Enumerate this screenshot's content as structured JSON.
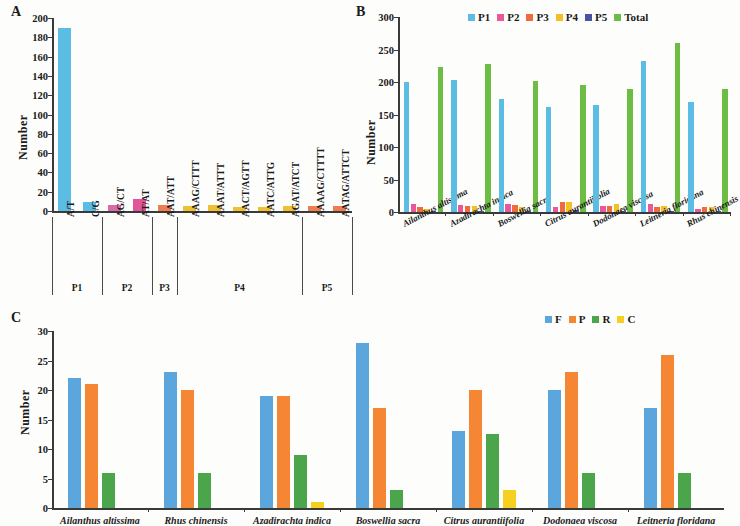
{
  "figure": {
    "panels": [
      "A",
      "B",
      "C"
    ],
    "axis_title": "Number"
  },
  "panelA": {
    "letter": "A",
    "ylabel": "Number",
    "yticks": [
      "0",
      "20",
      "40",
      "60",
      "80",
      "100",
      "120",
      "140",
      "160",
      "180",
      "200"
    ],
    "groups": [
      {
        "label": "P1",
        "members": [
          "A/T",
          "C/G"
        ]
      },
      {
        "label": "P2",
        "members": [
          "AG/CT",
          "AT/AT"
        ]
      },
      {
        "label": "P3",
        "members": [
          "AAT/ATT"
        ]
      },
      {
        "label": "P4",
        "members": [
          "AAAG/CTTT",
          "AAAT/ATTT",
          "AACT/AGTT",
          "AATC/ATTG",
          "AGAT/ATCT"
        ]
      },
      {
        "label": "P5",
        "members": [
          "AAAAG/CTTTT",
          "AATAG/ATTCT"
        ]
      }
    ],
    "chart_data": {
      "type": "bar",
      "title": "",
      "xlabel": "",
      "ylabel": "Number",
      "ylim": [
        0,
        200
      ],
      "categories": [
        "A/T",
        "C/G",
        "AG/CT",
        "AT/AT",
        "AAT/ATT",
        "AAAG/CTTT",
        "AAAT/ATTT",
        "AACT/AGTT",
        "AATC/ATTG",
        "AGAT/ATCT",
        "AAAAG/CTTTT",
        "AATAG/ATTCT"
      ],
      "values": [
        190,
        9,
        6,
        12,
        6,
        5,
        6,
        4,
        4,
        5,
        5,
        5
      ],
      "colors": [
        "#5bbce4",
        "#5bbce4",
        "#d96ba8",
        "#e2559a",
        "#ef7d52",
        "#efc132",
        "#efc132",
        "#efc132",
        "#efc132",
        "#efc132",
        "#ef7d52",
        "#ef7d52"
      ],
      "grid": false,
      "legend_position": "none"
    }
  },
  "panelB": {
    "letter": "B",
    "ylabel": "Number",
    "yticks": [
      "0",
      "50",
      "100",
      "150",
      "200",
      "250",
      "300"
    ],
    "legend": [
      {
        "label": "P1",
        "color": "#5bbce4"
      },
      {
        "label": "P2",
        "color": "#e8589b"
      },
      {
        "label": "P3",
        "color": "#ef6a3c"
      },
      {
        "label": "P4",
        "color": "#f5c026"
      },
      {
        "label": "P5",
        "color": "#4a53a2"
      },
      {
        "label": "Total",
        "color": "#6dbd45"
      }
    ],
    "chart_data": {
      "type": "bar",
      "title": "",
      "xlabel": "",
      "ylabel": "Number",
      "ylim": [
        0,
        300
      ],
      "categories": [
        "Ailanthus altissima",
        "Azadirachta indica",
        "Boswellia sacra",
        "Citrus aurantiifolia",
        "Dodonaea viscosa",
        "Leitneria floridana",
        "Rhus chinensis"
      ],
      "series": [
        {
          "name": "P1",
          "color": "#5bbce4",
          "values": [
            200,
            203,
            174,
            161,
            165,
            233,
            170
          ]
        },
        {
          "name": "P2",
          "color": "#e8589b",
          "values": [
            13,
            11,
            12,
            7,
            10,
            12,
            5
          ]
        },
        {
          "name": "P3",
          "color": "#ef6a3c",
          "values": [
            8,
            9,
            11,
            16,
            10,
            8,
            8
          ]
        },
        {
          "name": "P4",
          "color": "#f5c026",
          "values": [
            5,
            10,
            8,
            16,
            12,
            9,
            8
          ]
        },
        {
          "name": "P5",
          "color": "#4a53a2",
          "values": [
            2,
            2,
            2,
            3,
            2,
            2,
            2
          ]
        },
        {
          "name": "Total",
          "color": "#6dbd45",
          "values": [
            223,
            228,
            201,
            196,
            190,
            260,
            190
          ]
        }
      ],
      "grid": false,
      "legend_position": "top"
    }
  },
  "panelC": {
    "letter": "C",
    "ylabel": "Number",
    "yticks": [
      "0",
      "5",
      "10",
      "15",
      "20",
      "25",
      "30"
    ],
    "legend": [
      {
        "label": "F",
        "color": "#5ba7dd"
      },
      {
        "label": "P",
        "color": "#f58634"
      },
      {
        "label": "R",
        "color": "#4ba64b"
      },
      {
        "label": "C",
        "color": "#f5d021"
      }
    ],
    "chart_data": {
      "type": "bar",
      "title": "",
      "xlabel": "",
      "ylabel": "Number",
      "ylim": [
        0,
        30
      ],
      "categories": [
        "Ailanthus altissima",
        "Rhus chinensis",
        "Azadirachta indica",
        "Boswellia sacra",
        "Citrus aurantiifolia",
        "Dodonaea viscosa",
        "Leitneria floridana"
      ],
      "series": [
        {
          "name": "F",
          "color": "#5ba7dd",
          "values": [
            22,
            23,
            19,
            28,
            13,
            20,
            17
          ]
        },
        {
          "name": "P",
          "color": "#f58634",
          "values": [
            21,
            20,
            19,
            17,
            20,
            23,
            26
          ]
        },
        {
          "name": "R",
          "color": "#4ba64b",
          "values": [
            6,
            6,
            9,
            3,
            12.5,
            6,
            6
          ]
        },
        {
          "name": "C",
          "color": "#f5d021",
          "values": [
            0,
            0,
            1,
            0,
            3,
            0,
            0
          ]
        }
      ],
      "grid": false,
      "legend_position": "top-right"
    }
  }
}
